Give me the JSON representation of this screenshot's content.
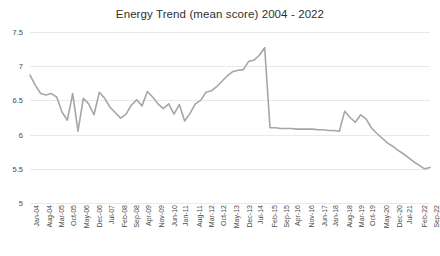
{
  "chart_data": {
    "type": "line",
    "title": "Energy Trend (mean score) 2004 - 2022",
    "xlabel": "",
    "ylabel": "",
    "ylim": [
      5,
      7.5
    ],
    "yticks": [
      7.5,
      7,
      6.5,
      6,
      5.5,
      5
    ],
    "grid": true,
    "legend": "none",
    "line_color": "#a6a6a6",
    "tick_labels": [
      "Jan-04",
      "Aug-04",
      "Mar-05",
      "Oct-05",
      "May-06",
      "Dec-06",
      "Jul-07",
      "Feb-08",
      "Sep-08",
      "Apr-09",
      "Nov-09",
      "Jun-10",
      "Jan-11",
      "Aug-11",
      "Mar-12",
      "Oct-12",
      "May-13",
      "Dec-13",
      "Jul-14",
      "Feb-15",
      "Sep-15",
      "Apr-16",
      "Nov-16",
      "Jun-17",
      "Jan-18",
      "Aug-18",
      "Mar-19",
      "Oct-19",
      "May-20",
      "Dec-20",
      "Jul-21",
      "Feb-22",
      "Sep-22"
    ],
    "x": [
      "Jan-04",
      "Apr-04",
      "Jul-04",
      "Oct-04",
      "Jan-05",
      "Apr-05",
      "Jul-05",
      "Oct-05",
      "Jan-06",
      "Apr-06",
      "Jul-06",
      "Oct-06",
      "Jan-07",
      "Apr-07",
      "Jul-07",
      "Oct-07",
      "Jan-08",
      "Apr-08",
      "Jul-08",
      "Oct-08",
      "Jan-09",
      "Apr-09",
      "Jul-09",
      "Oct-09",
      "Jan-10",
      "Apr-10",
      "Jul-10",
      "Oct-10",
      "Jan-11",
      "Apr-11",
      "Jul-11",
      "Oct-11",
      "Jan-12",
      "Apr-12",
      "Jul-12",
      "Oct-12",
      "Jan-13",
      "Apr-13",
      "Jul-13",
      "Oct-13",
      "Jan-14",
      "Apr-14",
      "Jul-14",
      "Oct-14",
      "Jan-15",
      "Apr-15",
      "Jul-15",
      "Oct-15",
      "Jan-16",
      "Apr-16",
      "Jul-16",
      "Oct-16",
      "Jan-17",
      "Apr-17",
      "Jul-17",
      "Oct-17",
      "Jan-18",
      "Apr-18",
      "Jul-18",
      "Oct-18",
      "Jan-19",
      "Apr-19",
      "Jul-19",
      "Oct-19",
      "Jan-20",
      "Apr-20",
      "Jul-20",
      "Oct-20",
      "Jan-21",
      "Apr-21",
      "Jul-21",
      "Oct-21",
      "Jan-22",
      "Apr-22",
      "Jul-22",
      "Sep-22"
    ],
    "values": [
      6.87,
      6.72,
      6.6,
      6.58,
      6.6,
      6.55,
      6.33,
      6.21,
      6.6,
      6.05,
      6.53,
      6.45,
      6.29,
      6.62,
      6.53,
      6.4,
      6.32,
      6.24,
      6.3,
      6.43,
      6.51,
      6.42,
      6.63,
      6.55,
      6.45,
      6.38,
      6.45,
      6.3,
      6.44,
      6.2,
      6.31,
      6.45,
      6.5,
      6.62,
      6.64,
      6.7,
      6.78,
      6.86,
      6.92,
      6.94,
      6.95,
      7.07,
      7.09,
      7.16,
      7.27,
      6.1,
      6.1,
      6.09,
      6.09,
      6.09,
      6.08,
      6.08,
      6.08,
      6.08,
      6.07,
      6.07,
      6.06,
      6.06,
      6.05,
      6.34,
      6.25,
      6.18,
      6.29,
      6.23,
      6.1,
      6.02,
      5.95,
      5.88,
      5.83,
      5.77,
      5.72,
      5.66,
      5.6,
      5.55,
      5.5,
      5.52
    ]
  }
}
